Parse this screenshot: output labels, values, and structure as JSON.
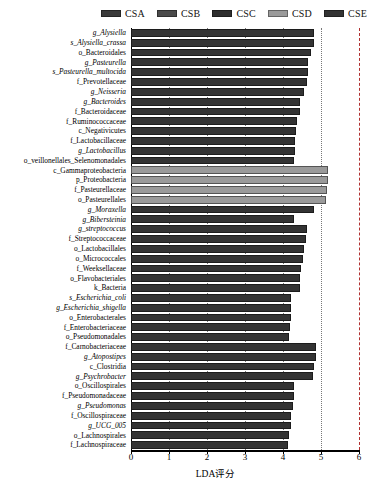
{
  "legend": {
    "items": [
      {
        "label": "CSA",
        "color": "#3a3a3a"
      },
      {
        "label": "CSB",
        "color": "#4a4a4a"
      },
      {
        "label": "CSC",
        "color": "#2e2e2e"
      },
      {
        "label": "CSD",
        "color": "#9a9a9a"
      },
      {
        "label": "CSE",
        "color": "#333333"
      }
    ]
  },
  "axis": {
    "x_title": "LDA评分",
    "x_ticks": [
      "0",
      "1",
      "2",
      "3",
      "4",
      "5",
      "6"
    ],
    "x_min": 0,
    "x_max": 6
  },
  "chart_data": {
    "type": "bar",
    "orientation": "horizontal",
    "title": "",
    "xlabel": "LDA评分",
    "ylabel": "",
    "xlim": [
      0,
      6
    ],
    "grid": true,
    "legend_position": "top-right",
    "categories": [
      "g_Alysiella",
      "s_Alysiella_crassa",
      "o_Bacteroidales",
      "g_Pasteurella",
      "s_Pasteurella_multocida",
      "f_Prevotellaceae",
      "g_Neisseria",
      "g_Bacteroides",
      "f_Bacteroidaceae",
      "f_Ruminococcaceae",
      "c_Negativicutes",
      "f_Lactobacillaceae",
      "g_Lactobacillus",
      "o_veillonellales_Selenomonadales",
      "c_Gammaproteobacteria",
      "p_Proteobacteria",
      "f_Pasteurellaceae",
      "o_Pasteurellales",
      "g_Moraxella",
      "g_Bibersteinia",
      "g_streptococcus",
      "f_Streptococcaceae",
      "o_Lactobacillales",
      "o_Micrococcales",
      "f_Weeksellaceae",
      "o_Flavobacteriales",
      "k_Bacteria",
      "s_Escherichia_coli",
      "g_Escherichia_shigella",
      "o_Enterobacterales",
      "f_Enterobacteriaceae",
      "o_Pseudomonadales",
      "f_Carnobacteriaceae",
      "g_Atopostipes",
      "c_Clostridia",
      "g_Psychrobacter",
      "o_Oscillospirales",
      "f_Pseudomonadaceae",
      "g_Pseudomonas",
      "f_Oscillospiraceae",
      "g_UCG_005",
      "o_Lachnospirales",
      "f_Lachnospiraceae"
    ],
    "values": [
      4.82,
      4.82,
      4.73,
      4.66,
      4.66,
      4.62,
      4.54,
      4.44,
      4.44,
      4.36,
      4.34,
      4.32,
      4.31,
      4.3,
      5.18,
      5.18,
      5.16,
      5.14,
      4.82,
      4.28,
      4.62,
      4.6,
      4.56,
      4.52,
      4.48,
      4.46,
      4.44,
      4.22,
      4.22,
      4.2,
      4.18,
      4.16,
      4.88,
      4.86,
      4.82,
      4.8,
      4.3,
      4.28,
      4.26,
      4.22,
      4.2,
      4.16,
      4.12
    ],
    "italic_labels": [
      "g_Alysiella",
      "s_Alysiella_crassa",
      "g_Pasteurella",
      "s_Pasteurella_multocida",
      "g_Neisseria",
      "g_Bacteroides",
      "g_Lactobacillus",
      "g_Moraxella",
      "g_Bibersteinia",
      "g_streptococcus",
      "s_Escherichia_coli",
      "g_Escherichia_shigella",
      "g_Atopostipes",
      "g_Psychrobacter",
      "g_Pseudomonas",
      "g_UCG_005"
    ],
    "group_colors": {
      "dark": "#333333",
      "light": "#9a9a9a"
    },
    "bar_groups": [
      "dark",
      "dark",
      "dark",
      "dark",
      "dark",
      "dark",
      "dark",
      "dark",
      "dark",
      "dark",
      "dark",
      "dark",
      "dark",
      "dark",
      "light",
      "light",
      "light",
      "light",
      "dark",
      "dark",
      "dark",
      "dark",
      "dark",
      "dark",
      "dark",
      "dark",
      "dark",
      "dark",
      "dark",
      "dark",
      "dark",
      "dark",
      "dark",
      "dark",
      "dark",
      "dark",
      "dark",
      "dark",
      "dark",
      "dark",
      "dark",
      "dark",
      "dark"
    ]
  }
}
